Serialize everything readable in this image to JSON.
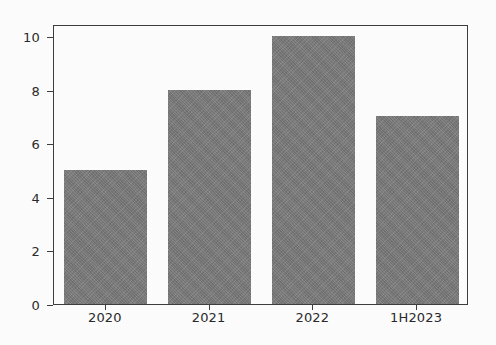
{
  "chart_data": {
    "type": "bar",
    "title": "",
    "subtitle": "",
    "xlabel": "",
    "ylabel": "",
    "categories": [
      "2020",
      "2021",
      "2022",
      "1H2023"
    ],
    "values": [
      5,
      8,
      10,
      7
    ],
    "series": [
      {
        "name": "",
        "values": [
          5,
          8,
          10,
          7
        ]
      }
    ],
    "ylim": [
      0,
      10.45
    ],
    "yticks": [
      0,
      2,
      4,
      6,
      8,
      10
    ],
    "ytick_labels": [
      "0",
      "2",
      "4",
      "6",
      "8",
      "10"
    ],
    "xtick_labels": [
      "2020",
      "2021",
      "2022",
      "1H2023"
    ],
    "grid": false,
    "legend": false,
    "legend_position": "none",
    "annotations": [],
    "bar_color": "#7b7b7b",
    "axis_color": "#3d3d3d",
    "background_color": "#fdfdfd"
  }
}
